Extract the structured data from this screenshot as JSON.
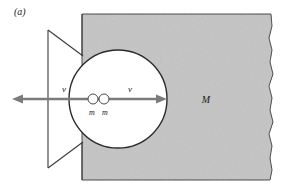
{
  "figure": {
    "panel_label": "(a)",
    "colors": {
      "background": "#ffffff",
      "block_fill": "#c4c4c4",
      "block_stroke": "#3a3a3a",
      "arrow": "#7b7b7b",
      "mass_fill": "#ffffff",
      "mass_stroke": "#4a4a4a",
      "text": "#1a1a1a"
    },
    "labels": {
      "velocity_left": "v",
      "velocity_right": "v",
      "mass_left": "m",
      "mass_right": "m",
      "big_mass": "M"
    },
    "geometry": {
      "arrow_axis_y": 99,
      "arrow_left_tip_x": 12,
      "arrow_right_tip_x": 167,
      "cavity_center_x": 118,
      "cavity_center_y": 99,
      "cavity_radius": 49,
      "block_left_x": 82,
      "block_top_y": 14,
      "block_bottom_y": 180,
      "block_right_x": 272,
      "mass_left_cx": 93,
      "mass_right_cx": 104,
      "mass_radius": 5,
      "funnel_left_x": 48,
      "funnel_top_y": 30,
      "funnel_bottom_y": 168
    }
  }
}
